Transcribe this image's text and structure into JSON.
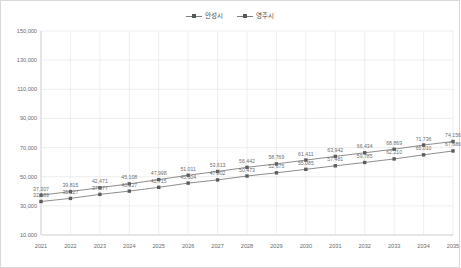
{
  "chart_data": {
    "type": "line",
    "title": "",
    "subtitle": "",
    "xlabel": "",
    "ylabel": "",
    "categories": [
      "2021",
      "2022",
      "2023",
      "2024",
      "2025",
      "2026",
      "2027",
      "2028",
      "2029",
      "2030",
      "2031",
      "2032",
      "2033",
      "2034",
      "2035"
    ],
    "ylim": [
      10000,
      150000
    ],
    "ytick_labels": [
      "150,000",
      "130,000",
      "110,000",
      "90,000",
      "70,000",
      "50,000",
      "30,000",
      "10,000"
    ],
    "ytick_values": [
      150000,
      130000,
      110000,
      90000,
      70000,
      50000,
      30000,
      10000
    ],
    "grid": true,
    "legend_position": "top-center",
    "show_data_labels": true,
    "series": [
      {
        "name": "안성시",
        "color": "#808080",
        "marker": "square",
        "values": [
          37307,
          39815,
          42471,
          45108,
          47998,
          51011,
          53613,
          56442,
          58769,
          61411,
          63942,
          66434,
          68869,
          71736,
          74156
        ],
        "labels": [
          "37,307",
          "39,815",
          "42,471",
          "45,108",
          "47,998",
          "51,011",
          "53,613",
          "56,442",
          "58,769",
          "61,411",
          "63,942",
          "66,434",
          "68,869",
          "71,736",
          "74,156"
        ]
      },
      {
        "name": "영주시",
        "color": "#808080",
        "marker": "square",
        "values": [
          32983,
          35127,
          37877,
          40127,
          42715,
          45604,
          47802,
          50473,
          52675,
          55085,
          57481,
          59785,
          62210,
          65010,
          67686
        ],
        "labels": [
          "32,983",
          "35,127",
          "37,877",
          "40,127",
          "42,715",
          "45,604",
          "47,802",
          "50,473",
          "52,675",
          "55,085",
          "57,481",
          "59,785",
          "62,210",
          "65,010",
          "67,686"
        ]
      }
    ]
  },
  "legend": {
    "entries": [
      {
        "label": "안성시"
      },
      {
        "label": "영주시"
      }
    ]
  }
}
